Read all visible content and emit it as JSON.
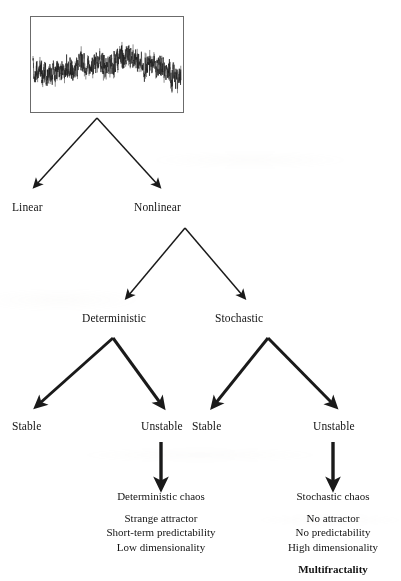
{
  "figure": {
    "background_color": "#ffffff",
    "ink_color": "#141414"
  },
  "signal_panel": {
    "name": "time-series-plot",
    "border_color": "#6b6b6b",
    "trace_color": "#1a1a1a",
    "description": "Irregular fluctuating time series trace"
  },
  "nodes": {
    "level1": [
      {
        "id": "linear",
        "label": "Linear"
      },
      {
        "id": "nonlinear",
        "label": "Nonlinear"
      }
    ],
    "level2": [
      {
        "id": "deterministic",
        "label": "Deterministic"
      },
      {
        "id": "stochastic",
        "label": "Stochastic"
      }
    ],
    "level3": [
      {
        "id": "det-stable",
        "label": "Stable"
      },
      {
        "id": "det-unstable",
        "label": "Unstable"
      },
      {
        "id": "sto-stable",
        "label": "Stable"
      },
      {
        "id": "sto-unstable",
        "label": "Unstable"
      }
    ]
  },
  "outcomes": [
    {
      "id": "deterministic-chaos",
      "title": "Deterministic chaos",
      "lines": [
        "Strange attractor",
        "Short-term predictability",
        "Low dimensionality"
      ],
      "emphasis": ""
    },
    {
      "id": "stochastic-chaos",
      "title": "Stochastic chaos",
      "lines": [
        "No attractor",
        "No predictability",
        "High dimensionality"
      ],
      "emphasis": "Multifractality"
    }
  ]
}
